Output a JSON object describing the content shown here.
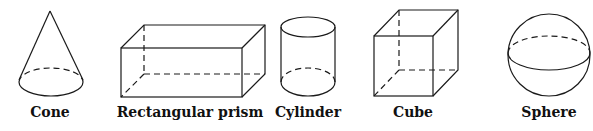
{
  "shapes": [
    {
      "id": "cone",
      "label": "Cone",
      "cx": 50
    },
    {
      "id": "rectangular-prism",
      "label": "Rectangular prism",
      "cx": 190
    },
    {
      "id": "cylinder",
      "label": "Cylinder",
      "cx": 308
    },
    {
      "id": "cube",
      "label": "Cube",
      "cx": 413
    },
    {
      "id": "sphere",
      "label": "Sphere",
      "cx": 549
    }
  ],
  "style": {
    "stroke": "#1a1a1a",
    "background": "#ffffff"
  }
}
